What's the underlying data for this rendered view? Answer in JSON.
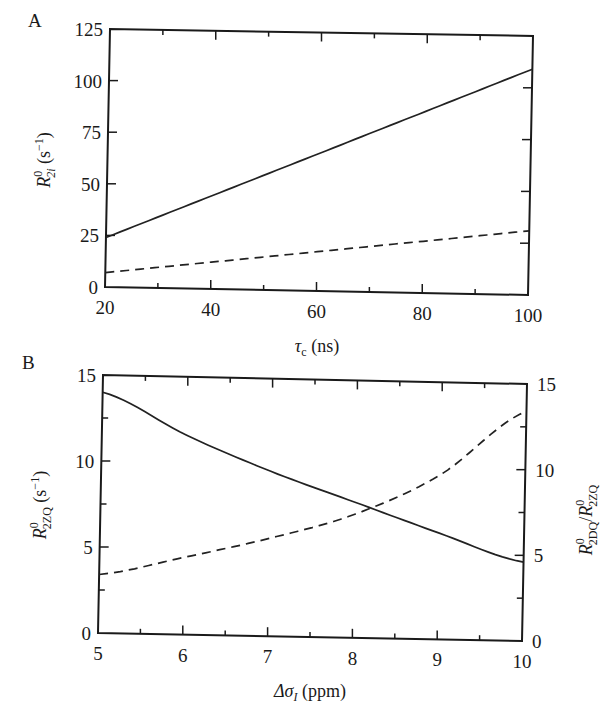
{
  "chart_data": [
    {
      "panel": "A",
      "type": "line",
      "xlabel": "τc (ns)",
      "ylabel": "R⁰₂ᵢ (s⁻¹)",
      "xlim": [
        20,
        100
      ],
      "ylim": [
        0,
        125
      ],
      "xticks": [
        20,
        40,
        60,
        80,
        100
      ],
      "yticks": [
        0,
        25,
        50,
        75,
        100,
        125
      ],
      "grid": false,
      "legend": null,
      "x": [
        20,
        40,
        60,
        80,
        100
      ],
      "series": [
        {
          "name": "solid",
          "style": "solid",
          "values": [
            24,
            45,
            66,
            88,
            109
          ]
        },
        {
          "name": "dashed",
          "style": "dashed",
          "values": [
            7,
            13,
            19,
            25,
            31
          ]
        }
      ]
    },
    {
      "panel": "B",
      "type": "line",
      "xlabel": "Δσ_I (ppm)",
      "ylabel": "R⁰₂ZQ (s⁻¹)",
      "ylabel_right": "R⁰₂DQ/R⁰₂ZQ",
      "xlim": [
        5,
        10
      ],
      "ylim": [
        0,
        15
      ],
      "ylim_right": [
        0,
        15
      ],
      "xticks": [
        5,
        6,
        7,
        8,
        9,
        10
      ],
      "yticks": [
        0,
        5,
        10,
        15
      ],
      "yticks_right": [
        0,
        5,
        10,
        15
      ],
      "grid": false,
      "legend": null,
      "x": [
        5,
        6,
        7,
        8,
        9,
        10
      ],
      "series": [
        {
          "name": "solid (left axis)",
          "style": "solid",
          "axis": "left",
          "values": [
            14.0,
            11.6,
            9.6,
            7.9,
            6.2,
            4.6
          ]
        },
        {
          "name": "dashed (right axis)",
          "style": "dashed",
          "axis": "right",
          "values": [
            3.4,
            4.5,
            5.7,
            7.2,
            9.6,
            13.4
          ]
        }
      ]
    }
  ],
  "labels": {
    "panel_a": "A",
    "panel_b": "B",
    "a_xlabel_sym": "τ",
    "a_xlabel_sub": "c",
    "a_xlabel_unit": " (ns)",
    "a_ylabel_R": "R",
    "a_ylabel_sup": "0",
    "a_ylabel_sub": "2i",
    "a_ylabel_unit": " (s",
    "a_ylabel_exp": "−1",
    "a_ylabel_close": ")",
    "b_xlabel_sym": "Δσ",
    "b_xlabel_sub": "I",
    "b_xlabel_unit": " (ppm)",
    "b_ylabel_R": "R",
    "b_ylabel_sup": "0",
    "b_ylabel_sub": "2ZQ",
    "b_ylabel_unit": " (s",
    "b_ylabel_exp": "−1",
    "b_ylabel_close": ")",
    "b_ylabel_right_R1": "R",
    "b_ylabel_right_sup1": "0",
    "b_ylabel_right_sub1": "2DQ",
    "b_ylabel_right_slash": "/",
    "b_ylabel_right_R2": "R",
    "b_ylabel_right_sup2": "0",
    "b_ylabel_right_sub2": "2ZQ"
  }
}
